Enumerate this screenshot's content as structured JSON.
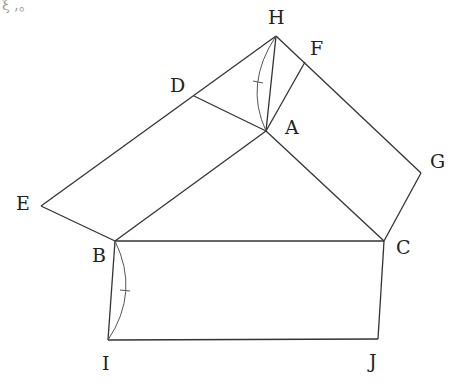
{
  "caption_fragment": "ξ ,。",
  "points": {
    "H": {
      "label": "H",
      "x": 276,
      "y": 36
    },
    "F": {
      "label": "F",
      "x": 305,
      "y": 62
    },
    "D": {
      "label": "D",
      "x": 194,
      "y": 96
    },
    "A": {
      "label": "A",
      "x": 266,
      "y": 131
    },
    "G": {
      "label": "G",
      "x": 421,
      "y": 173
    },
    "E": {
      "label": "E",
      "x": 41,
      "y": 206
    },
    "B": {
      "label": "B",
      "x": 115,
      "y": 241
    },
    "C": {
      "label": "C",
      "x": 384,
      "y": 241
    },
    "I": {
      "label": "I",
      "x": 108,
      "y": 340
    },
    "J": {
      "label": "J",
      "x": 378,
      "y": 339
    }
  },
  "segments": [
    [
      "H",
      "E"
    ],
    [
      "E",
      "B"
    ],
    [
      "B",
      "A"
    ],
    [
      "D",
      "A"
    ],
    [
      "H",
      "A"
    ],
    [
      "A",
      "F"
    ],
    [
      "H",
      "G"
    ],
    [
      "G",
      "C"
    ],
    [
      "A",
      "C"
    ],
    [
      "B",
      "C"
    ],
    [
      "B",
      "I"
    ],
    [
      "I",
      "J"
    ],
    [
      "J",
      "C"
    ]
  ],
  "equal_arcs": [
    {
      "from": "H",
      "to": "A",
      "note": "arc with tick mark"
    },
    {
      "from": "B",
      "to": "I",
      "note": "arc with tick mark"
    }
  ]
}
